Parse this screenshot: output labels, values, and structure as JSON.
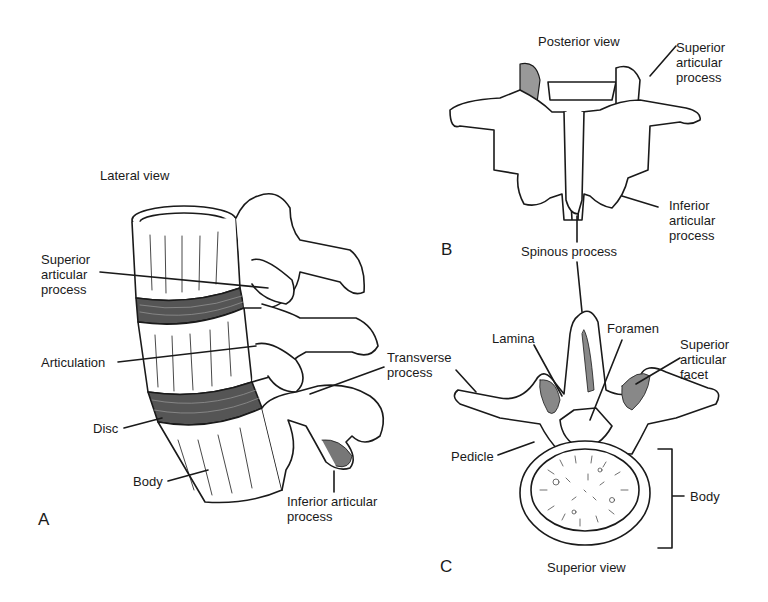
{
  "panels": {
    "A": {
      "letter": "A",
      "title": "Lateral view",
      "labels": {
        "superior_articular_process": "Superior\narticular\nprocess",
        "articulation": "Articulation",
        "disc": "Disc",
        "body": "Body",
        "transverse_process": "Transverse\nprocess",
        "inferior_articular_process": "Inferior articular\nprocess"
      }
    },
    "B": {
      "letter": "B",
      "title": "Posterior view",
      "labels": {
        "superior_articular_process": "Superior\narticular\nprocess",
        "inferior_articular_process": "Inferior\narticular\nprocess",
        "spinous_process": "Spinous process"
      }
    },
    "C": {
      "letter": "C",
      "title": "Superior view",
      "labels": {
        "lamina": "Lamina",
        "foramen": "Foramen",
        "superior_articular_facet": "Superior\narticular\nfacet",
        "pedicle": "Pedicle",
        "body": "Body"
      }
    }
  },
  "colors": {
    "ink": "#1a1a1a",
    "disc_fill": "#555555",
    "background": "#ffffff"
  }
}
